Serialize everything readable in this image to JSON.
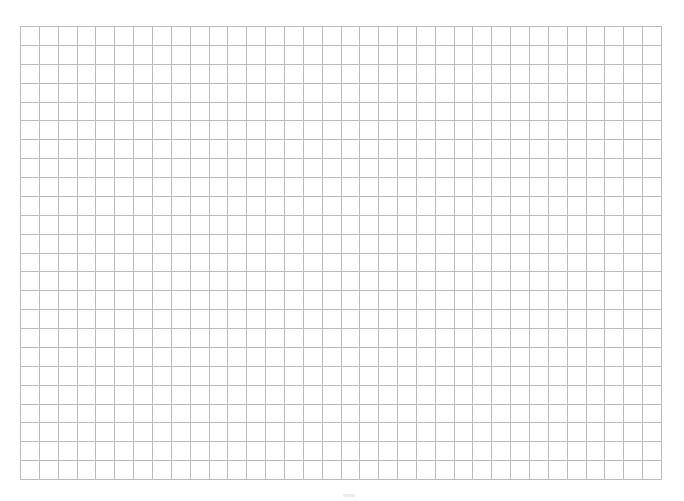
{
  "page": {
    "type": "grid-paper",
    "background_color": "#ffffff"
  },
  "grid": {
    "columns": 34,
    "rows": 24,
    "left": 20,
    "top": 26,
    "width": 641,
    "height": 453,
    "line_color": "#bcbcbc",
    "line_width": 1
  }
}
